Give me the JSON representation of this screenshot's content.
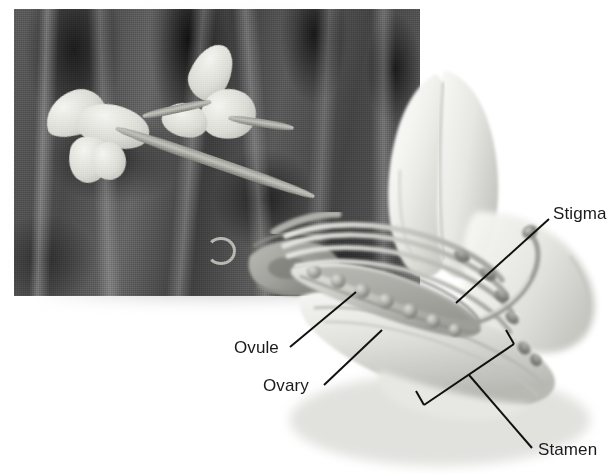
{
  "figure": {
    "background_color": "#ffffff",
    "ink_color": "#1b1b1b"
  },
  "photo_inset": {
    "name": "pea-plant-photograph",
    "description": "black and white photograph of pea plant with two pale blossoms on a stalk against dark foliage",
    "tone": "grayscale"
  },
  "drawing": {
    "name": "dissected-pea-flower-drawing",
    "description": "grayscale airbrush drawing of a cutaway pea flower showing banner petal, keel, ovary with ovules, stamens and stigma"
  },
  "labels": [
    {
      "id": "stigma",
      "text": "Stigma"
    },
    {
      "id": "ovule",
      "text": "Ovule"
    },
    {
      "id": "ovary",
      "text": "Ovary"
    },
    {
      "id": "stamen",
      "text": "Stamen"
    }
  ]
}
